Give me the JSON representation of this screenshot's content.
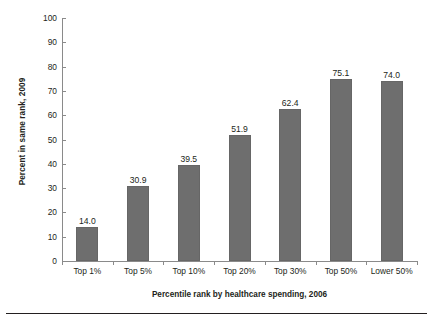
{
  "chart_data": {
    "type": "bar",
    "title": "",
    "subtitle": "",
    "xlabel": "Percentile rank by healthcare spending, 2006",
    "ylabel": "Percent in same rank, 2009",
    "categories": [
      "Top 1%",
      "Top 5%",
      "Top 10%",
      "Top 20%",
      "Top 30%",
      "Top 50%",
      "Lower 50%"
    ],
    "values": [
      14.0,
      30.9,
      39.5,
      51.9,
      62.4,
      75.1,
      74.0
    ],
    "value_labels": [
      "14.0",
      "30.9",
      "39.5",
      "51.9",
      "62.4",
      "75.1",
      "74.0"
    ],
    "ylim": [
      0,
      100
    ],
    "ytick_step": 10,
    "ytick_labels": [
      "0",
      "10",
      "20",
      "30",
      "40",
      "50",
      "60",
      "70",
      "80",
      "90",
      "100"
    ],
    "ytick_values": [
      0,
      10,
      20,
      30,
      40,
      50,
      60,
      70,
      80,
      90,
      100
    ],
    "grid": false,
    "legend": false,
    "legend_position": "none",
    "bar_color": "#6e6e6e",
    "bar_edge_color": "#666666",
    "axis_color": "#8a8a8a",
    "text_color": "#231f20",
    "background_color": "#ffffff",
    "rule_color": "#231f20"
  }
}
